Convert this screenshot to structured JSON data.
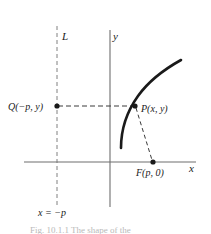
{
  "figure": {
    "axes": {
      "x_label": "x",
      "y_label": "y",
      "origin": [
        110,
        162
      ]
    },
    "directrix": {
      "line_label": "L",
      "equation_label": "x = −p",
      "x_position": 57,
      "style": "dashed"
    },
    "points": [
      {
        "name": "Q",
        "label": "Q(−p, y)",
        "x": 57,
        "y": 106
      },
      {
        "name": "P",
        "label": "P(x, y)",
        "x": 135,
        "y": 106
      },
      {
        "name": "F",
        "label": "F(p, 0)",
        "x": 153,
        "y": 162
      }
    ],
    "segments": [
      {
        "name": "qp-segment",
        "from": "Q",
        "to": "P",
        "style": "dashed"
      },
      {
        "name": "pf-segment",
        "from": "P",
        "to": "F",
        "style": "dashed"
      }
    ],
    "curve": {
      "name": "parabola-curve",
      "opens": "right",
      "stroke": "#1a1a1a"
    },
    "caption": "Fig. 10.1.1   The shape of the",
    "colors": {
      "ink": "#1a1a1a",
      "axis": "#6e6e6e",
      "dash": "#777777",
      "caption": "#b9b9b9",
      "background": "#ffffff"
    }
  }
}
